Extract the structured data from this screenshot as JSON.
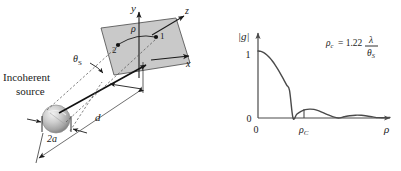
{
  "figure": {
    "title_visible": false,
    "panels": [
      {
        "id": "geometry-panel",
        "labels": {
          "axis_y": "y",
          "axis_x": "x",
          "axis_z": "z",
          "point_1": "1",
          "point_2": "2",
          "separation": "ρ",
          "angle": "θ",
          "angle_sub": "S",
          "source_line1": "Incoherent",
          "source_line2": "source",
          "source_diameter": "2a",
          "distance": "d"
        },
        "colors": {
          "plane_fill": "#c9c9c9",
          "plane_stroke": "#4a4a4a",
          "sphere_light": "#e8e8e8",
          "sphere_mid": "#b8b8b8",
          "sphere_dark": "#8a8a8a",
          "line": "#1a1a1a",
          "dashed": "#555555",
          "text": "#1a1a1a"
        }
      },
      {
        "id": "coherence-plot-panel",
        "labels": {
          "y_axis": "|g|",
          "x_axis": "ρ",
          "y_tick_1": "1",
          "y_tick_0": "0",
          "x_tick_0": "0",
          "x_tick_rc": "ρ",
          "x_tick_rc_sub": "C"
        },
        "annotation": {
          "lhs": "ρ",
          "lhs_sub": "c",
          "equals": "= 1.22",
          "numerator": "λ",
          "denominator": "θ",
          "denominator_sub": "S"
        },
        "colors": {
          "curve": "#4a4a4a",
          "axis": "#4a4a4a",
          "text": "#1a1a1a"
        }
      }
    ]
  },
  "chart_data": {
    "type": "line",
    "title": "",
    "xlabel": "ρ",
    "ylabel": "|g|",
    "xlim": [
      0,
      4.6
    ],
    "ylim": [
      0,
      1.12
    ],
    "grid": false,
    "legend": null,
    "x_ticks": [
      {
        "value": 0,
        "label": "0"
      },
      {
        "value": 1.22,
        "label": "ρc"
      }
    ],
    "y_ticks": [
      {
        "value": 0,
        "label": "0"
      },
      {
        "value": 1,
        "label": "1"
      }
    ],
    "annotations": [
      {
        "text": "ρc = 1.22 λ/θS",
        "x": 2.9,
        "y": 0.95
      }
    ],
    "series": [
      {
        "name": "|g(ρ)|",
        "description": "Besinc / Airy modulus: |2 J1(x)/x|, first zero at ρ = ρc",
        "x": [
          0.0,
          0.1,
          0.2,
          0.3,
          0.4,
          0.5,
          0.6,
          0.7,
          0.8,
          0.9,
          1.0,
          1.1,
          1.22,
          1.35,
          1.5,
          1.65,
          1.8,
          1.95,
          2.1,
          2.24,
          2.4,
          2.6,
          2.8,
          3.0,
          3.2,
          3.4,
          3.6,
          3.8,
          4.0,
          4.2,
          4.4,
          4.6
        ],
        "y": [
          1.0,
          0.994,
          0.975,
          0.945,
          0.903,
          0.851,
          0.79,
          0.722,
          0.648,
          0.57,
          0.49,
          0.409,
          0.0,
          0.055,
          0.1,
          0.125,
          0.132,
          0.128,
          0.11,
          0.085,
          0.055,
          0.02,
          0.0,
          0.018,
          0.034,
          0.042,
          0.04,
          0.03,
          0.016,
          0.005,
          0.004,
          0.01
        ]
      }
    ]
  }
}
